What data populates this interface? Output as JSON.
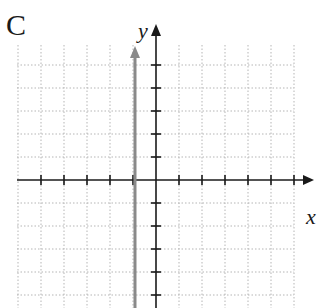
{
  "figure": {
    "panel_label": "C",
    "axes": {
      "x_label": "x",
      "y_label": "y"
    },
    "grid": {
      "x_min": -6,
      "x_max": 6,
      "y_min": -6,
      "y_max": 6,
      "cell_px": 23,
      "style": "dotted",
      "color": "#b5b5b5"
    },
    "graph": {
      "description": "vertical line x = -1 with arrowheads",
      "equation": "x = -1",
      "color": "#8a8a8a"
    },
    "colors": {
      "axis": "#1a1a1a",
      "tick": "#1a1a1a"
    }
  }
}
